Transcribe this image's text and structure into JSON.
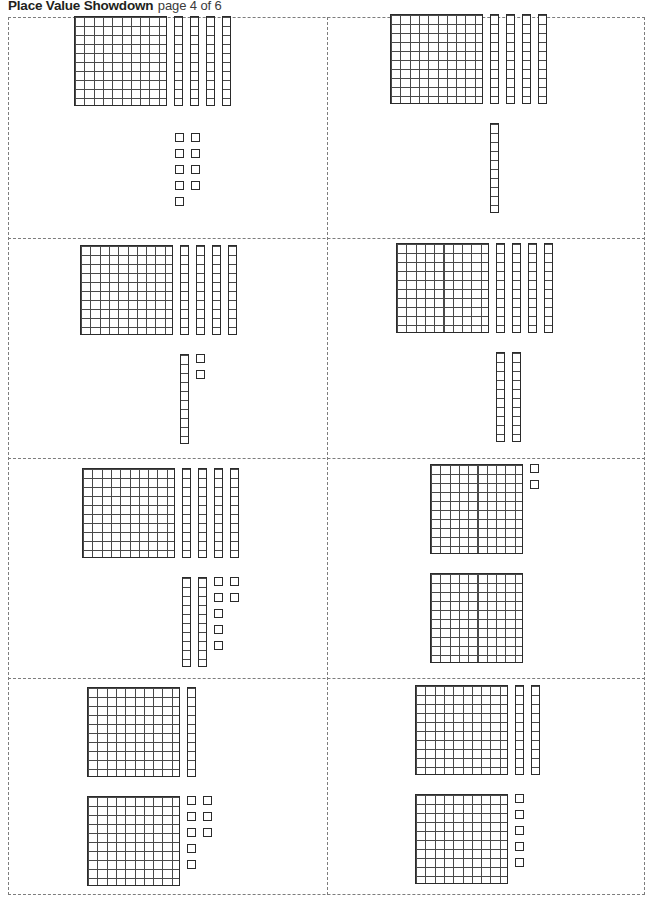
{
  "header": {
    "title": "Place Value Showdown",
    "page_label": "page 4 of 6"
  },
  "sheet": {
    "columns": 2,
    "rows": 4,
    "border_style": "dashed",
    "border_color": "#7d7d7d",
    "block_outline_color": "#2b2b2b",
    "block_grid_color": "#4a4a4a"
  },
  "legend": {
    "flat_name": "hundred-flat",
    "rod_name": "ten-rod",
    "unit_name": "one-unit",
    "flat_value": 100,
    "rod_value": 10,
    "unit_value": 1
  },
  "cards": [
    {
      "id": "card-1",
      "row": 1,
      "column": 1,
      "hundreds": 1,
      "tens": 4,
      "ones": 9,
      "value": 149,
      "groups": [
        {
          "type": "row",
          "flats": 1,
          "rods": 4,
          "units": 0
        },
        {
          "type": "row",
          "flats": 0,
          "rods": 0,
          "units": 9
        }
      ]
    },
    {
      "id": "card-2",
      "row": 1,
      "column": 2,
      "hundreds": 1,
      "tens": 5,
      "ones": 0,
      "value": 150,
      "groups": [
        {
          "type": "row",
          "flats": 1,
          "rods": 4,
          "units": 0
        },
        {
          "type": "row",
          "flats": 0,
          "rods": 1,
          "units": 0
        }
      ]
    },
    {
      "id": "card-3",
      "row": 2,
      "column": 1,
      "hundreds": 1,
      "tens": 5,
      "ones": 2,
      "value": 152,
      "groups": [
        {
          "type": "row",
          "flats": 1,
          "rods": 4,
          "units": 0
        },
        {
          "type": "row",
          "flats": 0,
          "rods": 1,
          "units": 2
        }
      ]
    },
    {
      "id": "card-4",
      "row": 2,
      "column": 2,
      "hundreds": 1,
      "tens": 6,
      "ones": 0,
      "value": 160,
      "groups": [
        {
          "type": "row",
          "flats": 1,
          "rods": 4,
          "units": 0
        },
        {
          "type": "row",
          "flats": 0,
          "rods": 2,
          "units": 0
        }
      ]
    },
    {
      "id": "card-5",
      "row": 3,
      "column": 1,
      "hundreds": 1,
      "tens": 6,
      "ones": 7,
      "value": 167,
      "groups": [
        {
          "type": "row",
          "flats": 1,
          "rods": 4,
          "units": 0
        },
        {
          "type": "row",
          "flats": 0,
          "rods": 2,
          "units": 7
        }
      ]
    },
    {
      "id": "card-6",
      "row": 3,
      "column": 2,
      "hundreds": 2,
      "tens": 0,
      "ones": 2,
      "value": 202,
      "groups": [
        {
          "type": "row",
          "flats": 1,
          "rods": 0,
          "units": 2
        },
        {
          "type": "row",
          "flats": 1,
          "rods": 0,
          "units": 0
        }
      ]
    },
    {
      "id": "card-7",
      "row": 4,
      "column": 1,
      "hundreds": 2,
      "tens": 1,
      "ones": 8,
      "value": 218,
      "groups": [
        {
          "type": "row",
          "flats": 1,
          "rods": 1,
          "units": 0
        },
        {
          "type": "row",
          "flats": 1,
          "rods": 0,
          "units": 8
        }
      ]
    },
    {
      "id": "card-8",
      "row": 4,
      "column": 2,
      "hundreds": 2,
      "tens": 2,
      "ones": 5,
      "value": 225,
      "groups": [
        {
          "type": "row",
          "flats": 1,
          "rods": 2,
          "units": 0
        },
        {
          "type": "row",
          "flats": 1,
          "rods": 0,
          "units": 5
        }
      ]
    }
  ],
  "layout": {
    "card_origins": [
      {
        "id": "card-1",
        "left": 74,
        "top": 16,
        "g1_left": 74,
        "g1_top": 16,
        "g2_left": 175,
        "g2_top": 133
      },
      {
        "id": "card-2",
        "left": 390,
        "top": 14,
        "g1_left": 390,
        "g1_top": 14,
        "g2_left": 490,
        "g2_top": 123
      },
      {
        "id": "card-3",
        "left": 80,
        "top": 245,
        "g1_left": 80,
        "g1_top": 245,
        "g2_left": 180,
        "g2_top": 354
      },
      {
        "id": "card-4",
        "left": 396,
        "top": 243,
        "g1_left": 396,
        "g1_top": 243,
        "g2_left": 496,
        "g2_top": 352
      },
      {
        "id": "card-5",
        "left": 82,
        "top": 468,
        "g1_left": 82,
        "g1_top": 468,
        "g2_left": 182,
        "g2_top": 577
      },
      {
        "id": "card-6",
        "left": 430,
        "top": 464,
        "g1_left": 430,
        "g1_top": 464,
        "g2_left": 430,
        "g2_top": 573
      },
      {
        "id": "card-7",
        "left": 87,
        "top": 687,
        "g1_left": 87,
        "g1_top": 687,
        "g2_left": 87,
        "g2_top": 796
      },
      {
        "id": "card-8",
        "left": 415,
        "top": 685,
        "g1_left": 415,
        "g1_top": 685,
        "g2_left": 415,
        "g2_top": 794
      }
    ]
  }
}
